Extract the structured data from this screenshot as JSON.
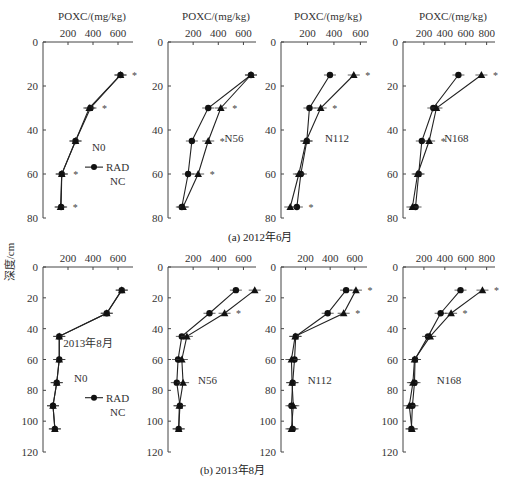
{
  "figure": {
    "ylabel": "深度/cm",
    "xlabel": "POXC/(mg/kg)",
    "captions": [
      "(a) 2012年6月",
      "(b) 2013年8月"
    ],
    "legend": {
      "series": [
        "RAD",
        "NC"
      ]
    },
    "row_annotation_2013": "2013年8月"
  },
  "chart_data": [
    {
      "type": "line",
      "panel": "N0",
      "period": "(a) 2012年6月",
      "xlabel": "POXC/(mg/kg)",
      "ylabel": "深度/cm",
      "xticks": [
        200,
        400,
        600
      ],
      "xlim": [
        0,
        720
      ],
      "yticks": [
        0,
        20,
        40,
        60,
        80
      ],
      "ylim": [
        0,
        80
      ],
      "depth": [
        15,
        30,
        45,
        60,
        75
      ],
      "series": [
        {
          "name": "RAD",
          "marker": "circle",
          "values": [
            620,
            380,
            260,
            150,
            145
          ]
        },
        {
          "name": "NC",
          "marker": "triangle",
          "values": [
            620,
            370,
            260,
            150,
            140
          ]
        }
      ],
      "significance_depths": [
        15,
        30,
        60,
        75
      ],
      "legend_position": "inside-right"
    },
    {
      "type": "line",
      "panel": "N56",
      "period": "(a) 2012年6月",
      "xticks": [
        200,
        400,
        600
      ],
      "xlim": [
        0,
        700
      ],
      "yticks": [
        0,
        20,
        40,
        60,
        80
      ],
      "ylim": [
        0,
        80
      ],
      "depth": [
        15,
        30,
        45,
        60,
        75
      ],
      "series": [
        {
          "name": "RAD",
          "marker": "circle",
          "values": [
            660,
            320,
            190,
            160,
            110
          ]
        },
        {
          "name": "NC",
          "marker": "triangle",
          "values": [
            660,
            420,
            320,
            240,
            120
          ]
        }
      ],
      "significance_depths": [
        30,
        45,
        60
      ]
    },
    {
      "type": "line",
      "panel": "N112",
      "period": "(a) 2012年6月",
      "xticks": [
        200,
        400,
        600
      ],
      "xlim": [
        0,
        650
      ],
      "yticks": [
        0,
        20,
        40,
        60,
        80
      ],
      "ylim": [
        0,
        80
      ],
      "depth": [
        15,
        30,
        45,
        60,
        75
      ],
      "series": [
        {
          "name": "RAD",
          "marker": "circle",
          "values": [
            370,
            215,
            195,
            150,
            120
          ]
        },
        {
          "name": "NC",
          "marker": "triangle",
          "values": [
            550,
            300,
            190,
            135,
            70
          ]
        }
      ],
      "significance_depths": [
        15,
        30,
        75
      ]
    },
    {
      "type": "line",
      "panel": "N168",
      "period": "(a) 2012年6月",
      "xticks": [
        200,
        400,
        600,
        800
      ],
      "xlim": [
        0,
        880
      ],
      "yticks": [
        0,
        20,
        40,
        60,
        80
      ],
      "ylim": [
        0,
        80
      ],
      "depth": [
        15,
        30,
        45,
        60,
        75
      ],
      "series": [
        {
          "name": "RAD",
          "marker": "circle",
          "values": [
            530,
            290,
            180,
            150,
            120
          ]
        },
        {
          "name": "NC",
          "marker": "triangle",
          "values": [
            750,
            320,
            250,
            140,
            90
          ]
        }
      ],
      "significance_depths": [
        15,
        45
      ]
    },
    {
      "type": "line",
      "panel": "N0",
      "period": "(b) 2013年8月",
      "xticks": [
        200,
        400,
        600
      ],
      "xlim": [
        0,
        720
      ],
      "yticks": [
        0,
        20,
        40,
        60,
        80,
        100,
        120
      ],
      "ylim": [
        0,
        120
      ],
      "depth": [
        15,
        30,
        45,
        60,
        75,
        90,
        105
      ],
      "series": [
        {
          "name": "RAD",
          "marker": "circle",
          "values": [
            630,
            510,
            130,
            130,
            110,
            80,
            95
          ]
        },
        {
          "name": "NC",
          "marker": "triangle",
          "values": [
            630,
            510,
            130,
            130,
            110,
            80,
            95
          ]
        }
      ],
      "significance_depths": [],
      "legend_position": "inside-right"
    },
    {
      "type": "line",
      "panel": "N56",
      "period": "(b) 2013年8月",
      "xticks": [
        200,
        400,
        600
      ],
      "xlim": [
        0,
        700
      ],
      "yticks": [
        0,
        20,
        40,
        60,
        80,
        100,
        120
      ],
      "ylim": [
        0,
        120
      ],
      "depth": [
        15,
        30,
        45,
        60,
        75,
        90,
        105
      ],
      "series": [
        {
          "name": "RAD",
          "marker": "circle",
          "values": [
            540,
            330,
            110,
            80,
            70,
            95,
            85
          ]
        },
        {
          "name": "NC",
          "marker": "triangle",
          "values": [
            690,
            450,
            150,
            110,
            120,
            90,
            85
          ]
        }
      ],
      "significance_depths": [
        30
      ]
    },
    {
      "type": "line",
      "panel": "N112",
      "period": "(b) 2013年8月",
      "xticks": [
        200,
        400,
        600
      ],
      "xlim": [
        0,
        700
      ],
      "yticks": [
        0,
        20,
        40,
        60,
        80,
        100,
        120
      ],
      "ylim": [
        0,
        120
      ],
      "depth": [
        15,
        30,
        45,
        60,
        75,
        90,
        105
      ],
      "series": [
        {
          "name": "RAD",
          "marker": "circle",
          "values": [
            530,
            380,
            120,
            110,
            95,
            85,
            95
          ]
        },
        {
          "name": "NC",
          "marker": "triangle",
          "values": [
            610,
            510,
            115,
            85,
            90,
            100,
            85
          ]
        }
      ],
      "significance_depths": [
        15,
        30
      ]
    },
    {
      "type": "line",
      "panel": "N168",
      "period": "(b) 2013年8月",
      "xticks": [
        200,
        400,
        600,
        800
      ],
      "xlim": [
        0,
        880
      ],
      "yticks": [
        0,
        20,
        40,
        60,
        80,
        100,
        120
      ],
      "ylim": [
        0,
        120
      ],
      "depth": [
        15,
        30,
        45,
        60,
        75,
        90,
        105
      ],
      "series": [
        {
          "name": "RAD",
          "marker": "circle",
          "values": [
            550,
            360,
            240,
            115,
            110,
            90,
            80
          ]
        },
        {
          "name": "NC",
          "marker": "triangle",
          "values": [
            760,
            460,
            260,
            110,
            95,
            60,
            85
          ]
        }
      ],
      "significance_depths": [
        15,
        30
      ]
    }
  ]
}
